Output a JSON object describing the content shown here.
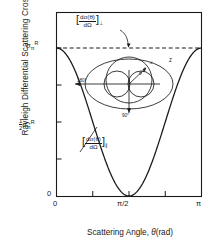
{
  "chart_data": {
    "type": "line",
    "title": "",
    "xlabel": "Scattering Angle, θ(rad)",
    "ylabel": "Rayleigh Differential Scattering Cross-Section",
    "xlim": [
      0,
      3.14159
    ],
    "ylim": [
      0,
      1.0
    ],
    "xticks": [
      "0",
      "π/2",
      "π"
    ],
    "xtick_values": [
      0,
      1.5708,
      3.14159
    ],
    "yticks": [
      "0",
      "½ σπR",
      "σπR"
    ],
    "ytick_values": [
      0,
      0.5,
      1.0
    ],
    "grid": false,
    "legend": "none",
    "series": [
      {
        "name": "[dσ(θ)/dΩ]⊥",
        "style": "dashed",
        "x": [
          0,
          0.3927,
          0.7854,
          1.1781,
          1.5708,
          1.9635,
          2.3562,
          2.7489,
          3.14159
        ],
        "y": [
          1.0,
          1.0,
          1.0,
          1.0,
          1.0,
          1.0,
          1.0,
          1.0,
          1.0
        ]
      },
      {
        "name": "[dσ(θ)/dΩ]∥",
        "style": "solid",
        "formula": "cos^2(theta)",
        "x": [
          0,
          0.19635,
          0.3927,
          0.58905,
          0.7854,
          0.98175,
          1.1781,
          1.37445,
          1.5708,
          1.76715,
          1.9635,
          2.15985,
          2.3562,
          2.55255,
          2.7489,
          2.94525,
          3.14159
        ],
        "y": [
          1.0,
          0.9619,
          0.8536,
          0.6913,
          0.5,
          0.3087,
          0.1464,
          0.0381,
          0.0,
          0.0381,
          0.1464,
          0.3087,
          0.5,
          0.6913,
          0.8536,
          0.9619,
          1.0
        ]
      }
    ]
  },
  "axes": {
    "y_label": "Rayleigh Differential Scattering Cross-Section",
    "x_label_pre": "Scattering Angle, ",
    "x_label_theta": "θ",
    "x_label_unit": "(rad)",
    "ytick_top_sigma": "σ",
    "ytick_top_sub": "π",
    "ytick_top_sup": "R",
    "ytick_half_num": "1",
    "ytick_half_den": "2",
    "ytick_zero": "0",
    "xtick_zero": "0",
    "xtick_mid": "π/2",
    "xtick_pi": "π"
  },
  "annotations": {
    "perp": {
      "numerator": "dσ(θ)",
      "denominator": "dΩ",
      "subscript": "⊥",
      "bracket_open": "[",
      "bracket_close": "]"
    },
    "parallel": {
      "numerator": "dσ(θ)",
      "denominator": "dΩ",
      "subscript": "∥",
      "bracket_open": "[",
      "bracket_close": "]"
    }
  },
  "inset": {
    "label_180": "180°",
    "label_90": "90°",
    "label_theta": "θ",
    "label_perp": "⊥",
    "label_par": "∥",
    "label_total": "Σ"
  },
  "colors": {
    "ink": "#1a1a1a",
    "curve": "#1a1a1a",
    "dashed": "#1a1a1a",
    "background": "#ffffff"
  }
}
